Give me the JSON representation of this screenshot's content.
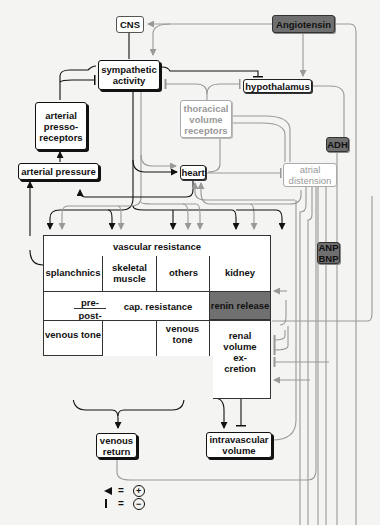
{
  "nodes": {
    "cns": "CNS",
    "angiotensin": "Angiotensin",
    "sympathetic": "sympathetic activity",
    "hypothalamus": "hypothalamus",
    "arterial_pressoreceptors": "arterial presso-receptors",
    "thoracical_volume_receptors": "thoracical volume receptors",
    "adh": "ADH",
    "arterial_pressure": "arterial pressure",
    "heart": "heart",
    "atrial_distension": "atrial distension",
    "anp_bnp": "ANP BNP",
    "venous_return": "venous return",
    "intravascular_volume": "intravascular volume"
  },
  "grid": {
    "vascular_resistance": "vascular resistance",
    "splanchnics": "splanchnics",
    "skeletal_muscle": "skeletal muscle",
    "others": "others",
    "kidney": "kidney",
    "pre": "pre-",
    "post": "post-",
    "cap_resistance": "cap. resistance",
    "renin_release": "renin release",
    "venous_tone_1": "venous tone",
    "venous_tone_2": "venous tone",
    "renal_volume_excretion": "renal volume ex-cretion"
  },
  "legend": {
    "arrow_meaning": "=",
    "arrow_sign": "+",
    "bar_meaning": "=",
    "bar_sign": "−"
  },
  "colors": {
    "primary_line": "#111111",
    "secondary_line": "#999999",
    "hormone_fill": "#6f6f6f",
    "renin_fill": "#707070"
  }
}
